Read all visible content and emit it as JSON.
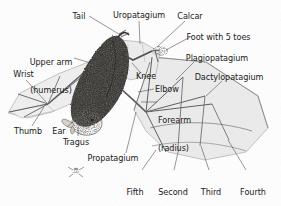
{
  "figure": {
    "background_color": "#ffffff",
    "text_color": "#1a1a1a",
    "leader_line_color": "#3c3c3c",
    "membrane_fill_color": "#e9e9e9",
    "body_fill_color": "#2e2a28",
    "width": 281,
    "height": 206
  },
  "labels": [
    {
      "id": "tail",
      "text": "Tail",
      "lines": [
        "Tail"
      ],
      "x": 79,
      "y": 12,
      "align": "center",
      "target_x": 122,
      "target_y": 36
    },
    {
      "id": "uropatagium",
      "text": "Uropatagium",
      "lines": [
        "Uropatagium"
      ],
      "x": 139,
      "y": 11,
      "align": "center",
      "target_x": 140,
      "target_y": 44
    },
    {
      "id": "calcar",
      "text": "Calcar",
      "lines": [
        "Calcar"
      ],
      "x": 190,
      "y": 12,
      "align": "center",
      "target_x": 156,
      "target_y": 48
    },
    {
      "id": "foot-with-5-toes",
      "text": "Foot with 5 toes",
      "lines": [
        "Foot with 5 toes"
      ],
      "x": 218,
      "y": 33,
      "align": "center",
      "target_x": 162,
      "target_y": 52
    },
    {
      "id": "upper-arm",
      "text": "Upper arm (humerus)",
      "lines": [
        "Upper arm",
        "(humerus)"
      ],
      "x": 51,
      "y": 44,
      "align": "center",
      "target_x": 92,
      "target_y": 62
    },
    {
      "id": "plagiopatagium",
      "text": "Plagiopatagium",
      "lines": [
        "Plagiopatagium"
      ],
      "x": 217,
      "y": 54,
      "align": "center",
      "target_x": 174,
      "target_y": 78
    },
    {
      "id": "wrist",
      "text": "Wrist",
      "lines": [
        "Wrist"
      ],
      "x": 18,
      "y": 71,
      "align": "center",
      "target_x": 47,
      "target_y": 103
    },
    {
      "id": "knee",
      "text": "Knee",
      "lines": [
        "Knee"
      ],
      "x": 146,
      "y": 72,
      "align": "center",
      "target_x": 131,
      "target_y": 63
    },
    {
      "id": "dactylopatagium",
      "text": "Dactylopatagium",
      "lines": [
        "Dactylopatagium"
      ],
      "x": 224,
      "y": 73,
      "align": "center",
      "target_x": 205,
      "target_y": 95
    },
    {
      "id": "elbow",
      "text": "Elbow",
      "lines": [
        "Elbow"
      ],
      "x": 155,
      "y": 86,
      "align": "left",
      "target_x": 137,
      "target_y": 91
    },
    {
      "id": "forearm-radius",
      "text": "Forearm (radius)",
      "lines": [
        "Forearm",
        "(radius)"
      ],
      "x": 158,
      "y": 99,
      "align": "left",
      "target_x": 140,
      "target_y": 101
    },
    {
      "id": "thumb",
      "text": "Thumb",
      "lines": [
        "Thumb"
      ],
      "x": 26,
      "y": 128,
      "align": "center",
      "target_x": 44,
      "target_y": 106
    },
    {
      "id": "ear",
      "text": "Ear",
      "lines": [
        "Ear"
      ],
      "x": 58,
      "y": 128,
      "align": "center",
      "target_x": 76,
      "target_y": 119
    },
    {
      "id": "tragus",
      "text": "Tragus",
      "lines": [
        "Tragus"
      ],
      "x": 76,
      "y": 139,
      "align": "center",
      "target_x": 79,
      "target_y": 124
    },
    {
      "id": "propatagium",
      "text": "Propatagium",
      "lines": [
        "Propatagium"
      ],
      "x": 113,
      "y": 155,
      "align": "center",
      "target_x": 134,
      "target_y": 111
    },
    {
      "id": "fifth-finger",
      "text": "Fifth finger",
      "lines": [
        "Fifth",
        "finger"
      ],
      "x": 135,
      "y": 174,
      "align": "center",
      "target_x": 152,
      "target_y": 155
    },
    {
      "id": "second-finger",
      "text": "Second finger",
      "lines": [
        "Second",
        "finger"
      ],
      "x": 173,
      "y": 174,
      "align": "center",
      "target_x": 178,
      "target_y": 148
    },
    {
      "id": "third-finger",
      "text": "Third finger",
      "lines": [
        "Third",
        "finger"
      ],
      "x": 212,
      "y": 174,
      "align": "center",
      "target_x": 200,
      "target_y": 145
    },
    {
      "id": "fourth-finger",
      "text": "Fourth finger",
      "lines": [
        "Fourth",
        "finger"
      ],
      "x": 248,
      "y": 174,
      "align": "center",
      "target_x": 227,
      "target_y": 139
    }
  ],
  "artwork_parts": [
    {
      "id": "bat-body",
      "name": "bat-body"
    },
    {
      "id": "bat-head",
      "name": "bat-head"
    },
    {
      "id": "left-wing",
      "name": "left-wing-folded"
    },
    {
      "id": "right-wing",
      "name": "right-wing-outstretched"
    },
    {
      "id": "tail-membrane",
      "name": "uropatagium-membrane"
    },
    {
      "id": "insect",
      "name": "insect-prey"
    }
  ]
}
